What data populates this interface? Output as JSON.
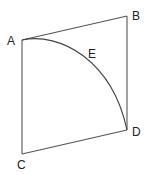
{
  "diagram": {
    "type": "geometry-figure",
    "colors": {
      "stroke": "#555555",
      "text": "#222222",
      "background": "#ffffff"
    },
    "points": [
      {
        "id": "A",
        "label": "A",
        "x": 22,
        "y": 40,
        "label_x": 7,
        "label_y": 45
      },
      {
        "id": "B",
        "label": "B",
        "x": 127,
        "y": 16,
        "label_x": 132,
        "label_y": 20
      },
      {
        "id": "C",
        "label": "C",
        "x": 22,
        "y": 154,
        "label_x": 17,
        "label_y": 169
      },
      {
        "id": "D",
        "label": "D",
        "x": 127,
        "y": 130,
        "label_x": 132,
        "label_y": 136
      },
      {
        "id": "E",
        "label": "E",
        "x": 92,
        "y": 54,
        "label_x": 88,
        "label_y": 58
      }
    ],
    "segments": [
      {
        "from": "A",
        "to": "B"
      },
      {
        "from": "B",
        "to": "D"
      },
      {
        "from": "D",
        "to": "C"
      },
      {
        "from": "C",
        "to": "A"
      }
    ],
    "arcs": [
      {
        "from": "A",
        "to": "D",
        "through": "E"
      }
    ]
  }
}
